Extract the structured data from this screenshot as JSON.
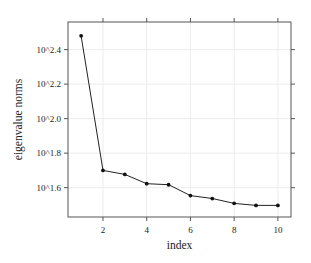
{
  "chart_data": {
    "type": "line",
    "title": "",
    "xlabel": "index",
    "ylabel": "eigenvalue norms",
    "x": [
      1,
      2,
      3,
      4,
      5,
      6,
      7,
      8,
      9,
      10
    ],
    "series": [
      {
        "name": "eigenvalue norms (log10)",
        "values": [
          2.48,
          1.7,
          1.677,
          1.623,
          1.617,
          1.554,
          1.537,
          1.509,
          1.497,
          1.497
        ]
      }
    ],
    "y_scale": "log10",
    "xlim": [
      0.4,
      10.6
    ],
    "ylim": [
      1.43,
      2.56
    ],
    "x_ticks": [
      2,
      4,
      6,
      8,
      10
    ],
    "x_tick_labels": [
      "2",
      "4",
      "6",
      "8",
      "10"
    ],
    "y_ticks": [
      1.6,
      1.8,
      2.0,
      2.2,
      2.4
    ],
    "y_tick_labels": [
      "10^1.6",
      "10^1.8",
      "10^2.0",
      "10^2.2",
      "10^2.4"
    ],
    "grid": true,
    "legend": "none"
  },
  "style": {
    "line_color": "#222222",
    "point_color": "#111111",
    "frame_color": "#555555",
    "grid_color": "#ececec"
  }
}
